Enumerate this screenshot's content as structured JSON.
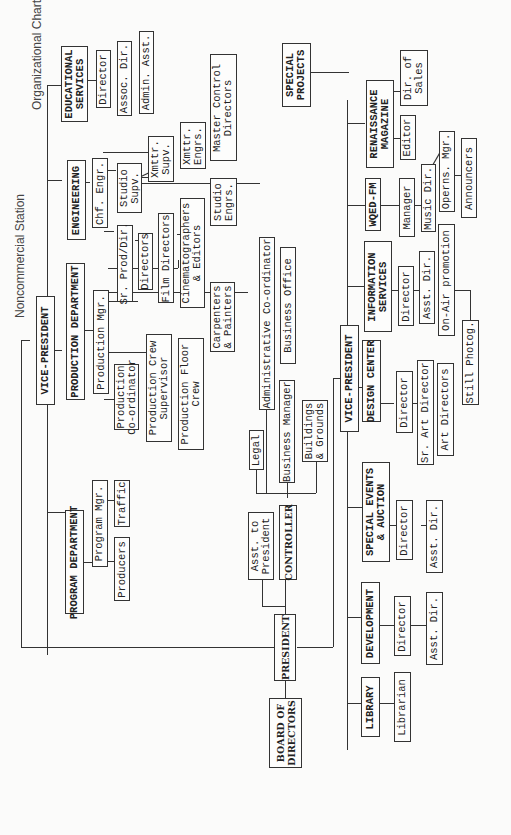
{
  "header": {
    "title": "Organizational Chart",
    "subtitle": "Noncommercial Station",
    "partial_top_text": "WQED, Pittsburgh"
  },
  "chart": {
    "board": "BOARD OF\nDIRECTORS",
    "president": "PRESIDENT",
    "asst_to_president": "Asst. to\nPresident",
    "controller": {
      "label": "CONTROLLER",
      "children": [
        "Legal",
        "Administrative Co-ordinator",
        "Business Manager",
        "Business Office",
        "Buildings\n& Grounds"
      ]
    },
    "vp_upper": {
      "label": "VICE-PRESIDENT",
      "program": {
        "label": "PROGRAM DEPARTMENT",
        "program_mgr": "Program Mgr.",
        "traffic": "Traffic",
        "producers": "Producers"
      },
      "production": {
        "label": "PRODUCTION DEPARTMENT",
        "production_mgr": "Production Mgr.",
        "sr_prod_dir": "Sr. Prod/Dir.",
        "directors": "Directors",
        "film_directors": "Film Directors",
        "cinematographers": "Cinematographers\n& Editors",
        "carpenters": "Carpenters\n& Painters",
        "prod_coordinator": "Production\nCo-ordinator",
        "crew_supervisor": "Production Crew\nSupervisor",
        "floor_crew": "Production Floor\nCrew"
      },
      "engineering": {
        "label": "ENGINEERING",
        "chf_engr": "Chf. Engr.",
        "studio_supv": "Studio\nSupv.",
        "xmttr_supv": "Xmttr.\nSupv.",
        "xmttr_engrs": "Xmttr.\nEngrs.",
        "master_control": "Master Control\nDirectors",
        "studio_engrs": "Studio\nEngrs."
      },
      "educational": {
        "label": "EDUCATIONAL\nSERVICES",
        "director": "Director",
        "assoc_dir": "Assoc. Dir.",
        "admin_asst": "Admin. Asst."
      }
    },
    "vp_lower": {
      "label": "VICE-PRESIDENT",
      "library": {
        "label": "LIBRARY",
        "librarian": "Librarian"
      },
      "development": {
        "label": "DEVELOPMENT",
        "director": "Director",
        "asst_dir": "Asst. Dir."
      },
      "special_events": {
        "label": "SPECIAL EVENTS\n& AUCTION",
        "director": "Director",
        "asst_dir": "Asst. Dir."
      },
      "design_center": {
        "label": "DESIGN CENTER",
        "director": "Director",
        "sr_art_director": "Sr. Art Director",
        "art_directors": "Art Directors"
      },
      "information": {
        "label": "INFORMATION\nSERVICES",
        "director": "Director",
        "asst_dir": "Asst. Dir.",
        "on_air": "On-Air promotion",
        "still_photog": "Still Photog."
      },
      "wqed_fm": {
        "label": "WQED-FM",
        "manager": "Manager",
        "music_dir": "Music Dir.",
        "operns_mgr": "Operns. Mgr.",
        "announcers": "Announcers"
      },
      "renaissance": {
        "label": "RENAISSANCE\nMAGAZINE",
        "editor": "Editor",
        "dir_sales": "Dir. of\nSales"
      }
    },
    "special_projects": "SPECIAL\nPROJECTS"
  }
}
